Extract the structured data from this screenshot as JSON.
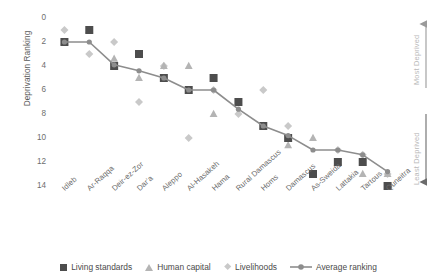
{
  "chart_data": {
    "type": "scatter",
    "title": "",
    "xlabel": "",
    "ylabel": "Deprivation Ranking",
    "ylim": [
      0,
      14
    ],
    "y_inverted": true,
    "yticks": [
      0,
      2,
      4,
      6,
      8,
      10,
      12,
      14
    ],
    "grid": false,
    "legend_position": "bottom",
    "categories": [
      "Idleb",
      "Ar-Raqqa",
      "Deir-ez-Zor",
      "Dar'a",
      "Aleppo",
      "Al-Hasakeh",
      "Hama",
      "Rural Damascus",
      "Homs",
      "Damascus",
      "As-Sweida",
      "Lattakia",
      "Tartous",
      "Quneitra"
    ],
    "series": [
      {
        "name": "Living standards",
        "marker": "square",
        "color": "#4d4d4d",
        "values": [
          2,
          1,
          4,
          3,
          5,
          6,
          5,
          7,
          9,
          10,
          13,
          12,
          12,
          14
        ]
      },
      {
        "name": "Human capital",
        "marker": "triangle",
        "color": "#b4b4b4",
        "values": [
          2,
          1,
          3.4,
          5,
          4,
          4,
          8,
          7,
          9,
          10.6,
          10,
          12,
          13,
          13
        ]
      },
      {
        "name": "Livelihoods",
        "marker": "diamond",
        "color": "#c9c9c9",
        "values": [
          1,
          3,
          2,
          7,
          4,
          10,
          6,
          8,
          6,
          9,
          13,
          11,
          11.4,
          13
        ]
      },
      {
        "name": "Average ranking",
        "marker": "line-circle",
        "color": "#8d8d8d",
        "values": [
          2,
          2,
          3.9,
          4.4,
          5,
          6,
          6,
          7.6,
          9,
          9.8,
          11,
          11,
          11.4,
          12.8
        ]
      }
    ],
    "annotations": [
      {
        "text": "Most Deprived",
        "position": "right-top",
        "arrow": "up"
      },
      {
        "text": "Least Deprived",
        "position": "right-bottom",
        "arrow": "down"
      }
    ]
  },
  "axis": {
    "y_title": "Deprivation Ranking",
    "y_ticks": [
      "0",
      "2",
      "4",
      "6",
      "8",
      "10",
      "12",
      "14"
    ]
  },
  "legend": {
    "items": [
      {
        "label": "Living standards"
      },
      {
        "label": "Human capital"
      },
      {
        "label": "Livelihoods"
      },
      {
        "label": "Average ranking"
      }
    ]
  },
  "right_axis": {
    "most": "Most Deprived",
    "least": "Least Deprived"
  }
}
